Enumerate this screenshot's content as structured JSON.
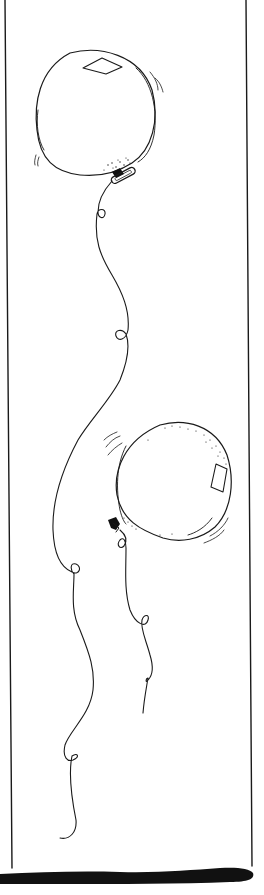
{
  "illustration": {
    "subject": "Two balloons with curly strings",
    "alt": "Hand-drawn line illustration of two balloons with long looping strings inside a narrow frame",
    "colors": {
      "ink": "#1a1a1a",
      "background": "#ffffff"
    },
    "elements": [
      {
        "name": "balloon-top",
        "description": "Round balloon with diamond highlight and clip at base"
      },
      {
        "name": "balloon-bottom",
        "description": "Round balloon with stippled shading and rectangular highlight"
      },
      {
        "name": "string-top",
        "description": "Long wavy string with several loops"
      },
      {
        "name": "string-bottom",
        "description": "Shorter wavy string with loops"
      },
      {
        "name": "frame",
        "description": "Thin vertical border lines with thick black base bar"
      }
    ]
  }
}
